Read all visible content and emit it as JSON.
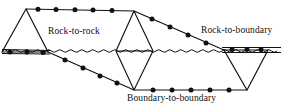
{
  "figure": {
    "type": "geotechnical-mesh-diagram",
    "width": 283,
    "height": 108,
    "background_color": "#ffffff",
    "stroke_color": "#111111",
    "node_color": "#111111",
    "labels": {
      "rock_to_rock": "Rock-to-rock",
      "rock_to_boundary": "Rock-to-boundary",
      "boundary_to_boundary": "Boundary-to-boundary"
    },
    "water_table": {
      "name": "wavy-water-table-line",
      "y": 51,
      "x_start": 2,
      "x_end": 281,
      "amplitude": 2.4,
      "wavelength": 11
    },
    "geometry": {
      "left_triangle": {
        "apex": [
          26,
          9
        ],
        "base_left": [
          2,
          52
        ],
        "base_right": [
          48,
          52
        ]
      },
      "center_diamond": {
        "top": [
          134,
          11
        ],
        "left": [
          116,
          51
        ],
        "right": [
          153,
          51
        ],
        "bottom": [
          134,
          90
        ]
      },
      "right_triangle": {
        "top_left": [
          224,
          50
        ],
        "top_right": [
          268,
          50
        ],
        "bottom": [
          247,
          90
        ]
      },
      "top_edge": {
        "from": [
          26,
          9
        ],
        "to": [
          134,
          11
        ]
      },
      "upper_right_diagonal": {
        "from": [
          134,
          11
        ],
        "to": [
          224,
          50
        ]
      },
      "lower_left_diagonal": {
        "from": [
          48,
          52
        ],
        "to": [
          134,
          90
        ]
      },
      "bottom_edge": {
        "from": [
          134,
          90
        ],
        "to": [
          247,
          90
        ]
      },
      "horizontal_rules": [
        {
          "y": 49,
          "x_start": 2,
          "x_end": 50
        },
        {
          "y": 54,
          "x_start": 2,
          "x_end": 50
        },
        {
          "y": 48,
          "x_start": 222,
          "x_end": 281
        },
        {
          "y": 53,
          "x_start": 222,
          "x_end": 281
        }
      ]
    },
    "nodes": {
      "top_edge": [
        [
          38,
          9.2
        ],
        [
          56,
          9.5
        ],
        [
          75,
          9.8
        ],
        [
          93,
          10.1
        ],
        [
          112,
          10.5
        ]
      ],
      "upper_right_diagonal": [
        [
          152,
          19
        ],
        [
          170,
          27
        ],
        [
          188,
          35
        ],
        [
          206,
          43
        ]
      ],
      "lower_left_diagonal": [
        [
          65,
          60
        ],
        [
          83,
          68
        ],
        [
          100,
          76
        ],
        [
          117,
          83
        ]
      ],
      "bottom_edge": [
        [
          153,
          90
        ],
        [
          172,
          90
        ],
        [
          191,
          90
        ],
        [
          210,
          90
        ],
        [
          229,
          90
        ]
      ],
      "left_base": [
        [
          10,
          52
        ],
        [
          27,
          52
        ],
        [
          43,
          52
        ]
      ],
      "right_top": [
        [
          232,
          50
        ],
        [
          247,
          50
        ],
        [
          261,
          50
        ]
      ]
    },
    "node_radius": 2.4
  }
}
